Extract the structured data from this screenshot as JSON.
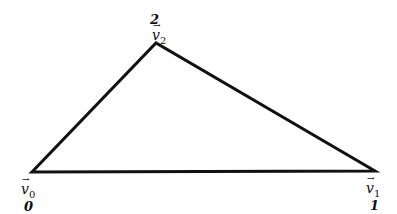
{
  "diagram": {
    "type": "triangle",
    "stroke_color": "#111111",
    "vertices": [
      {
        "name": "v0",
        "symbol": "v",
        "subscript": "0",
        "index_label": "0",
        "x": 32,
        "y": 172
      },
      {
        "name": "v1",
        "symbol": "v",
        "subscript": "1",
        "index_label": "1",
        "x": 375,
        "y": 171
      },
      {
        "name": "v2",
        "symbol": "v",
        "subscript": "2",
        "index_label": "2",
        "x": 156,
        "y": 43
      }
    ],
    "arrow_glyph": "→"
  }
}
